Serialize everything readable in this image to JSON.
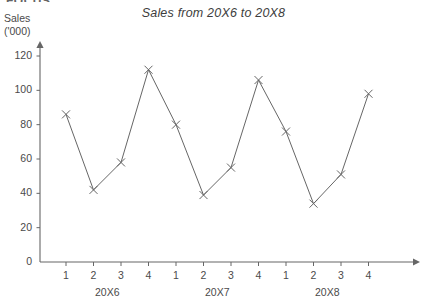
{
  "page": {
    "clipped_header_text": "FOCUS:",
    "background_color": "#ffffff",
    "ink_color": "#555555"
  },
  "axis_caption": {
    "line1": "Sales",
    "line2": "('000)"
  },
  "chart_data": {
    "type": "line",
    "title": "Sales from 20X6 to 20X8",
    "xlabel": "",
    "ylabel": "Sales ('000)",
    "ylim": [
      0,
      120
    ],
    "yticks": [
      0,
      20,
      40,
      60,
      80,
      100,
      120
    ],
    "ytick_labels": [
      "0",
      "20",
      "40",
      "60",
      "80",
      "100",
      "120"
    ],
    "grid": false,
    "legend": "none",
    "marker": "x",
    "line_color": "#666666",
    "categories": [
      "20X6 Q1",
      "20X6 Q2",
      "20X6 Q3",
      "20X6 Q4",
      "20X7 Q1",
      "20X7 Q2",
      "20X7 Q3",
      "20X7 Q4",
      "20X8 Q1",
      "20X8 Q2",
      "20X8 Q3",
      "20X8 Q4"
    ],
    "xtick_labels": [
      "1",
      "2",
      "3",
      "4",
      "1",
      "2",
      "3",
      "4",
      "1",
      "2",
      "3",
      "4"
    ],
    "group_labels": [
      "20X6",
      "20X7",
      "20X8"
    ],
    "values": [
      86,
      42,
      58,
      112,
      80,
      39,
      55,
      106,
      76,
      34,
      51,
      98
    ]
  }
}
